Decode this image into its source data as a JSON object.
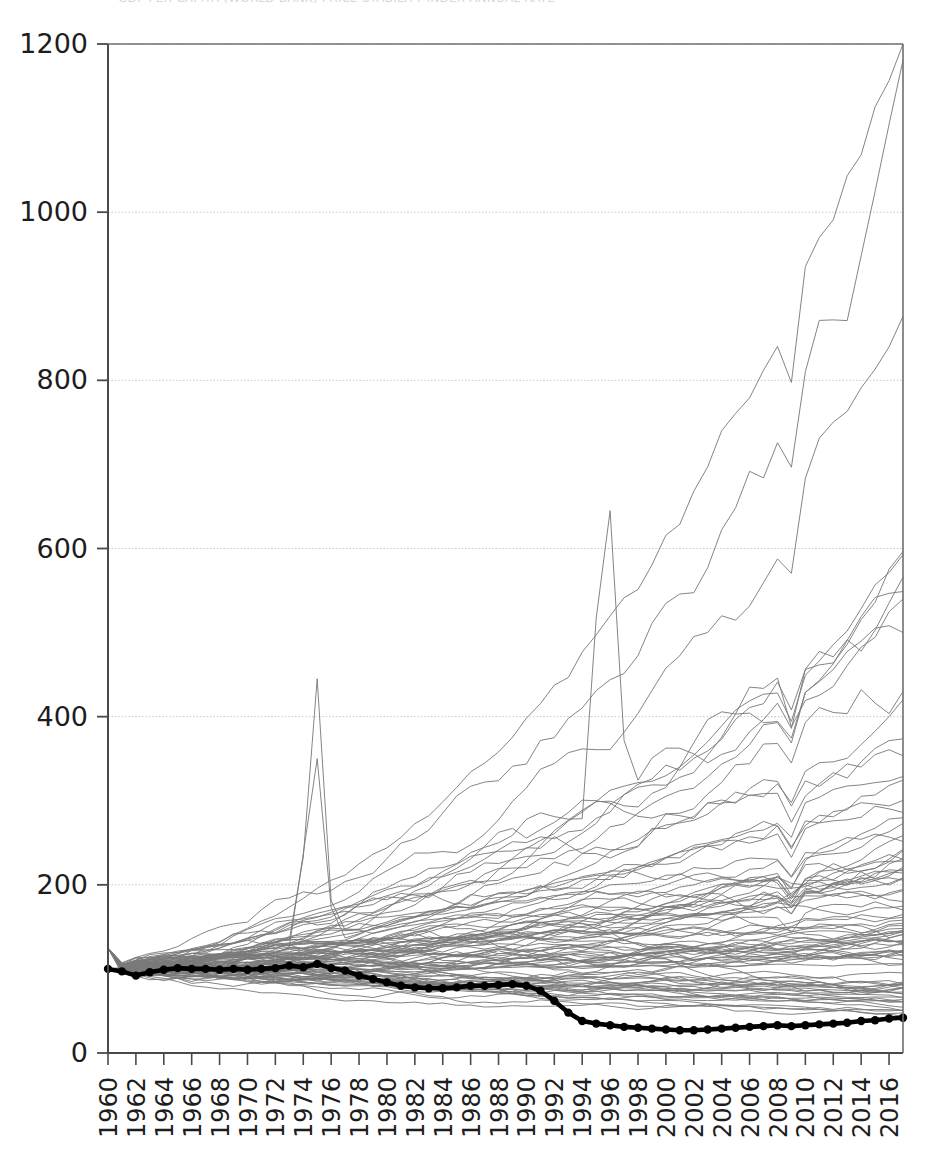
{
  "caption": {
    "text": "GDP PER CAPITA (WORLD BANK)        PRICE STABILITY INDEX        ANNUAL RATE"
  },
  "chart_data": {
    "type": "line",
    "title": "",
    "subtitle": "",
    "xlabel": "",
    "ylabel": "",
    "xlim": [
      1960,
      2017
    ],
    "ylim": [
      0,
      1200
    ],
    "grid": true,
    "grid_axis": "y",
    "legend": "none",
    "x_tick_step": 2,
    "y_tick_step": 200,
    "index_base_year": 1960,
    "index_base_value": 100,
    "yticks": [
      0,
      200,
      400,
      600,
      800,
      1000,
      1200
    ],
    "xticks": [
      1960,
      1962,
      1964,
      1966,
      1968,
      1970,
      1972,
      1974,
      1976,
      1978,
      1980,
      1982,
      1984,
      1986,
      1988,
      1990,
      1992,
      1994,
      1996,
      1998,
      2000,
      2002,
      2004,
      2006,
      2008,
      2010,
      2012,
      2014,
      2016
    ],
    "x": [
      1960,
      1961,
      1962,
      1963,
      1964,
      1965,
      1966,
      1967,
      1968,
      1969,
      1970,
      1971,
      1972,
      1973,
      1974,
      1975,
      1976,
      1977,
      1978,
      1979,
      1980,
      1981,
      1982,
      1983,
      1984,
      1985,
      1986,
      1987,
      1988,
      1989,
      1990,
      1991,
      1992,
      1993,
      1994,
      1995,
      1996,
      1997,
      1998,
      1999,
      2000,
      2001,
      2002,
      2003,
      2004,
      2005,
      2006,
      2007,
      2008,
      2009,
      2010,
      2011,
      2012,
      2013,
      2014,
      2015,
      2016,
      2017
    ],
    "highlight_series": {
      "name": "highlighted-country",
      "style": "bold-black-with-markers",
      "color": "#000000",
      "values": [
        100,
        97,
        92,
        96,
        99,
        101,
        100,
        100,
        99,
        100,
        99,
        100,
        101,
        104,
        102,
        106,
        101,
        98,
        92,
        88,
        84,
        80,
        78,
        77,
        77,
        78,
        80,
        80,
        81,
        82,
        80,
        74,
        62,
        48,
        38,
        35,
        33,
        31,
        30,
        29,
        28,
        27,
        27,
        28,
        29,
        30,
        31,
        32,
        33,
        32,
        33,
        34,
        35,
        36,
        38,
        39,
        41,
        42
      ]
    },
    "background_series_count": 92,
    "background_series_color": "#7a7a7a",
    "background_series_note": "Approximately 90 thin grey index lines, all rebased to 100 in 1960, fanning upward; most end between 60 and 600, a few outliers peak near 1070 and 940 in 2017 and one spikes to ~445 in 1975.",
    "background_series_endpoints_2017": [
      1070,
      940,
      855,
      600,
      565,
      545,
      520,
      475,
      440,
      415,
      400,
      398,
      360,
      340,
      330,
      320,
      300,
      290,
      280,
      275,
      265,
      255,
      250,
      240,
      235,
      230,
      225,
      220,
      215,
      212,
      208,
      205,
      200,
      195,
      190,
      188,
      185,
      182,
      178,
      175,
      170,
      168,
      165,
      160,
      158,
      155,
      152,
      148,
      145,
      142,
      140,
      138,
      135,
      132,
      130,
      128,
      125,
      122,
      120,
      118,
      115,
      112,
      110,
      108,
      105,
      102,
      100,
      98,
      95,
      92,
      90,
      88,
      85,
      82,
      80,
      78,
      76,
      74,
      72,
      70,
      68,
      67,
      66,
      65,
      64,
      63,
      62,
      61,
      60,
      59,
      58,
      57
    ],
    "notable_features": [
      {
        "year": 1975,
        "value": 445,
        "note": "sharp single-year spike"
      },
      {
        "year": 1975,
        "value": 350,
        "note": "secondary spike"
      },
      {
        "year": 1996,
        "value": 645,
        "note": "local peak on fast riser"
      },
      {
        "year": 1998,
        "value": 565,
        "note": "dip after peak"
      },
      {
        "year": 2008,
        "value": 470,
        "note": "pre-crisis cluster peak"
      },
      {
        "year": 2009,
        "value": 415,
        "note": "post-crisis dip"
      }
    ]
  },
  "axes": {
    "y_tick_labels": [
      "0",
      "200",
      "400",
      "600",
      "800",
      "1000",
      "1200"
    ],
    "x_tick_labels": [
      "1960",
      "1962",
      "1964",
      "1966",
      "1968",
      "1970",
      "1972",
      "1974",
      "1976",
      "1978",
      "1980",
      "1982",
      "1984",
      "1986",
      "1988",
      "1990",
      "1992",
      "1994",
      "1996",
      "1998",
      "2000",
      "2002",
      "2004",
      "2006",
      "2008",
      "2010",
      "2012",
      "2014",
      "2016"
    ]
  },
  "colors": {
    "background": "#ffffff",
    "axis": "#4a4a4a",
    "grid": "#bdbdbd",
    "series": "#7a7a7a",
    "highlight": "#000000",
    "text": "#1d1d1d"
  }
}
